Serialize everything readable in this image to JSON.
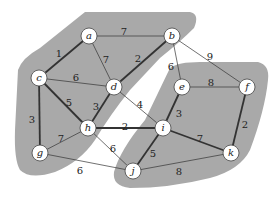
{
  "diagram": {
    "type": "weighted-graph-partition",
    "colors": {
      "region": "#a9a9a9",
      "background": "#ffffff",
      "edge": "#333333",
      "node_fill": "#ffffff",
      "node_stroke": "#444444"
    },
    "nodes": [
      {
        "id": "a",
        "label": "a",
        "x": 89,
        "y": 36
      },
      {
        "id": "b",
        "label": "b",
        "x": 172,
        "y": 36
      },
      {
        "id": "c",
        "label": "c",
        "x": 39,
        "y": 78
      },
      {
        "id": "d",
        "label": "d",
        "x": 114,
        "y": 87
      },
      {
        "id": "e",
        "label": "e",
        "x": 182,
        "y": 87
      },
      {
        "id": "f",
        "label": "f",
        "x": 247,
        "y": 87
      },
      {
        "id": "g",
        "label": "g",
        "x": 40,
        "y": 153
      },
      {
        "id": "h",
        "label": "h",
        "x": 88,
        "y": 128
      },
      {
        "id": "i",
        "label": "i",
        "x": 163,
        "y": 128
      },
      {
        "id": "j",
        "label": "j",
        "x": 133,
        "y": 171
      },
      {
        "id": "k",
        "label": "k",
        "x": 231,
        "y": 153
      }
    ],
    "edges": [
      {
        "from": "a",
        "to": "b",
        "weight": "7",
        "thick": false,
        "lx": 124,
        "ly": 32
      },
      {
        "from": "a",
        "to": "c",
        "weight": "1",
        "thick": true,
        "lx": 59,
        "ly": 54
      },
      {
        "from": "a",
        "to": "d",
        "weight": "7",
        "thick": false,
        "lx": 106,
        "ly": 60
      },
      {
        "from": "b",
        "to": "d",
        "weight": "2",
        "thick": true,
        "lx": 138,
        "ly": 59
      },
      {
        "from": "b",
        "to": "e",
        "weight": "6",
        "thick": false,
        "lx": 171,
        "ly": 67
      },
      {
        "from": "b",
        "to": "f",
        "weight": "9",
        "thick": false,
        "lx": 210,
        "ly": 57
      },
      {
        "from": "c",
        "to": "d",
        "weight": "6",
        "thick": false,
        "lx": 76,
        "ly": 78
      },
      {
        "from": "c",
        "to": "h",
        "weight": "5",
        "thick": true,
        "lx": 69,
        "ly": 103
      },
      {
        "from": "c",
        "to": "g",
        "weight": "3",
        "thick": true,
        "lx": 32,
        "ly": 120
      },
      {
        "from": "d",
        "to": "h",
        "weight": "3",
        "thick": true,
        "lx": 96,
        "ly": 107
      },
      {
        "from": "d",
        "to": "i",
        "weight": "4",
        "thick": false,
        "lx": 140,
        "ly": 105
      },
      {
        "from": "e",
        "to": "f",
        "weight": "8",
        "thick": false,
        "lx": 211,
        "ly": 83
      },
      {
        "from": "e",
        "to": "i",
        "weight": "3",
        "thick": true,
        "lx": 179,
        "ly": 114
      },
      {
        "from": "f",
        "to": "k",
        "weight": "2",
        "thick": true,
        "lx": 245,
        "ly": 125
      },
      {
        "from": "g",
        "to": "h",
        "weight": "7",
        "thick": false,
        "lx": 61,
        "ly": 139
      },
      {
        "from": "g",
        "to": "j",
        "weight": "6",
        "thick": false,
        "lx": 80,
        "ly": 171
      },
      {
        "from": "h",
        "to": "i",
        "weight": "2",
        "thick": true,
        "lx": 125,
        "ly": 127
      },
      {
        "from": "h",
        "to": "j",
        "weight": "6",
        "thick": false,
        "lx": 113,
        "ly": 149
      },
      {
        "from": "i",
        "to": "j",
        "weight": "5",
        "thick": true,
        "lx": 153,
        "ly": 154
      },
      {
        "from": "i",
        "to": "k",
        "weight": "7",
        "thick": true,
        "lx": 200,
        "ly": 139
      },
      {
        "from": "j",
        "to": "k",
        "weight": "8",
        "thick": false,
        "lx": 179,
        "ly": 172
      }
    ]
  }
}
